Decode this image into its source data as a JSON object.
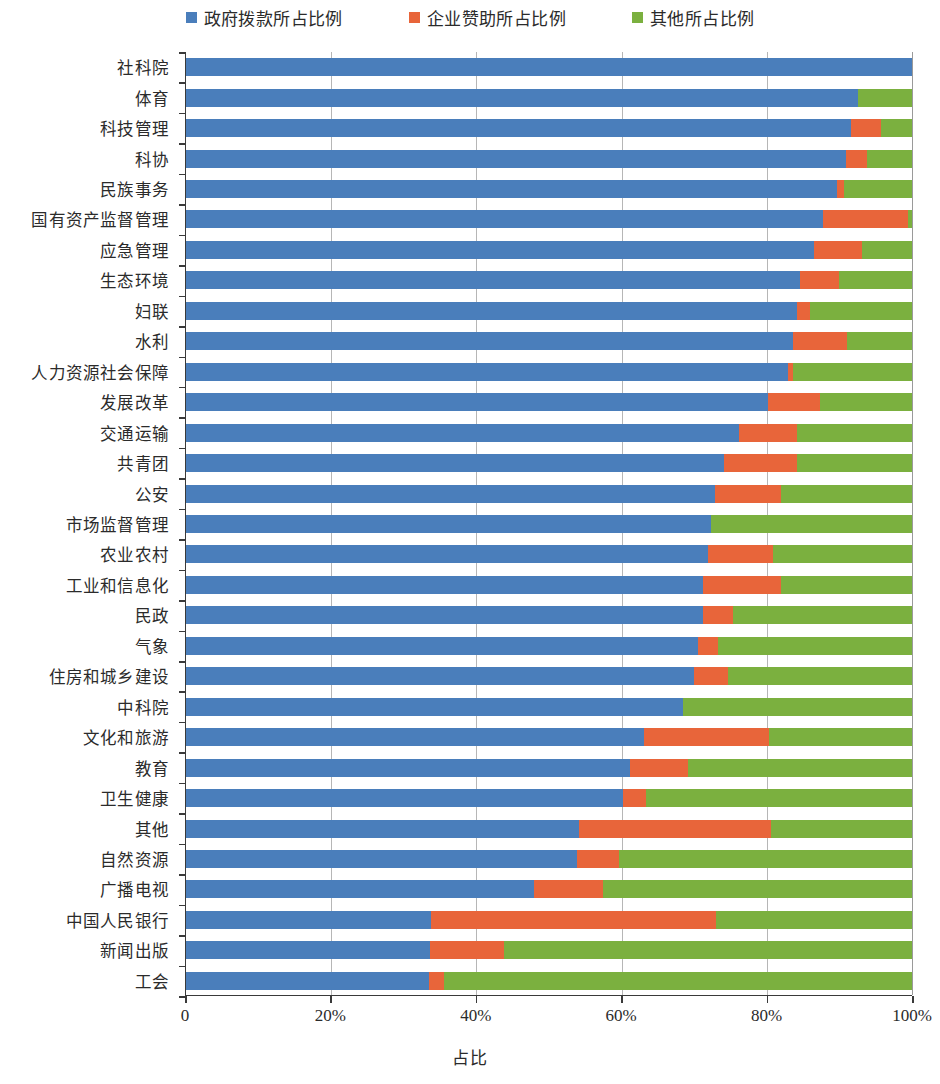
{
  "legend": {
    "position": "top-center",
    "items": [
      {
        "label": "政府拨款所占比例",
        "color": "#4a7ebb",
        "key": "gov"
      },
      {
        "label": "企业赞助所占比例",
        "color": "#e8653a",
        "key": "corp"
      },
      {
        "label": "其他所占比例",
        "color": "#7bb03f",
        "key": "other"
      }
    ]
  },
  "axis": {
    "x_title": "占比",
    "x_ticks": [
      "0",
      "20%",
      "40%",
      "60%",
      "80%",
      "100%"
    ],
    "x_tick_values": [
      0,
      20,
      40,
      60,
      80,
      100
    ],
    "xlim": [
      0,
      100
    ],
    "grid": "vertical"
  },
  "chart_data": {
    "type": "bar",
    "orientation": "horizontal",
    "stacked": true,
    "normalized_percent": true,
    "title": "",
    "subtitle": "",
    "xlabel": "占比",
    "ylabel": "",
    "xlim": [
      0,
      100
    ],
    "grid": true,
    "legend_position": "top-center",
    "legend": [
      "政府拨款所占比例",
      "企业赞助所占比例",
      "其他所占比例"
    ],
    "colors": {
      "gov": "#4a7ebb",
      "corp": "#e8653a",
      "other": "#7bb03f"
    },
    "categories": [
      "社科院",
      "体育",
      "科技管理",
      "科协",
      "民族事务",
      "国有资产监督管理",
      "应急管理",
      "生态环境",
      "妇联",
      "水利",
      "人力资源社会保障",
      "发展改革",
      "交通运输",
      "共青团",
      "公安",
      "市场监督管理",
      "农业农村",
      "工业和信息化",
      "民政",
      "气象",
      "住房和城乡建设",
      "中科院",
      "文化和旅游",
      "教育",
      "卫生健康",
      "其他",
      "自然资源",
      "广播电视",
      "中国人民银行",
      "新闻出版",
      "工会"
    ],
    "series": [
      {
        "name": "政府拨款所占比例",
        "key": "gov",
        "color": "#4a7ebb",
        "values": [
          100.0,
          92.5,
          91.6,
          90.9,
          89.7,
          87.8,
          86.5,
          84.6,
          84.2,
          83.6,
          82.9,
          80.2,
          76.2,
          74.1,
          72.8,
          72.3,
          71.9,
          71.2,
          71.2,
          70.5,
          70.0,
          68.5,
          63.1,
          61.2,
          60.2,
          54.2,
          53.9,
          47.9,
          33.8,
          33.6,
          33.5
        ]
      },
      {
        "name": "企业赞助所占比例",
        "key": "corp",
        "color": "#e8653a",
        "values": [
          0.0,
          0.0,
          4.1,
          2.9,
          1.0,
          11.6,
          6.6,
          5.3,
          1.8,
          7.5,
          0.7,
          7.1,
          7.9,
          10.0,
          9.1,
          0.0,
          8.9,
          10.7,
          4.1,
          2.8,
          4.7,
          0.0,
          17.2,
          8.0,
          3.2,
          26.4,
          5.7,
          9.5,
          39.2,
          10.2,
          2.0
        ]
      },
      {
        "name": "其他所占比例",
        "key": "other",
        "color": "#7bb03f",
        "values": [
          0.0,
          7.5,
          4.3,
          6.2,
          9.3,
          0.6,
          6.9,
          10.1,
          14.0,
          8.9,
          16.4,
          12.7,
          15.9,
          15.9,
          18.1,
          27.7,
          19.2,
          18.1,
          24.7,
          26.7,
          25.3,
          31.5,
          19.7,
          30.8,
          36.6,
          19.4,
          40.4,
          42.6,
          27.0,
          56.2,
          64.5
        ]
      }
    ]
  }
}
